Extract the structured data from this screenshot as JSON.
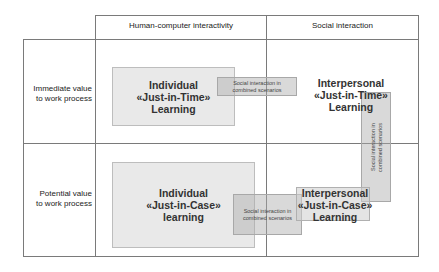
{
  "columns": {
    "col1": "Human-computer interactivity",
    "col2": "Social interaction"
  },
  "rows": {
    "row1": [
      "Immediate value",
      "to work process"
    ],
    "row2": [
      "Potential value",
      "to work process"
    ]
  },
  "quadrants": {
    "individual_jit": [
      "Individual",
      "«Just-in-Time»",
      "Learning"
    ],
    "interpersonal_jit": [
      "Interpersonal",
      "«Just-in-Time»",
      "Learning"
    ],
    "individual_jic": [
      "Individual",
      "«Just-in-Case»",
      "learning"
    ],
    "interpersonal_jic": [
      "Interpersonal",
      "«Just-in-Case»",
      "Learning"
    ]
  },
  "connectors": {
    "top": [
      "Social interaction in",
      "combined scenarios"
    ],
    "right": [
      "Social interaction in",
      "combined scenarios"
    ],
    "bottom": [
      "Social interaction in",
      "combined scenarios"
    ]
  },
  "colors": {
    "grid_line": "#7a7a7a",
    "quadrant_fill": "#e1e1e1",
    "connector_fill": "#c8c8c8"
  }
}
